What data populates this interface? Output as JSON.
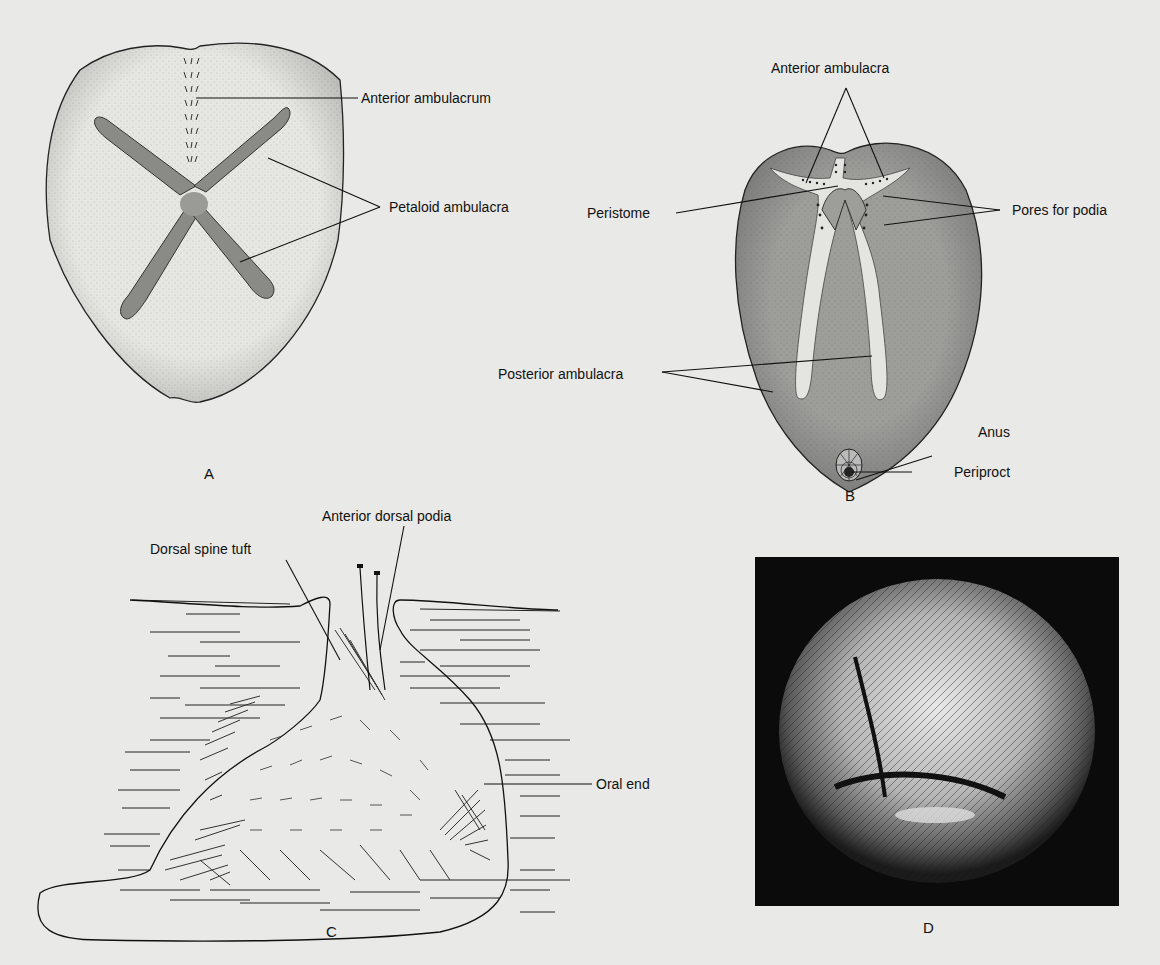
{
  "figure": {
    "background_color": "#e9e9e7",
    "panels": [
      {
        "id": "A",
        "letter": "A",
        "labels": {
          "anterior_ambulacrum": "Anterior ambulacrum",
          "petaloid_ambulacra": "Petaloid ambulacra"
        }
      },
      {
        "id": "B",
        "letter": "B",
        "labels": {
          "anterior_ambulacra": "Anterior ambulacra",
          "peristome": "Peristome",
          "pores_for_podia": "Pores for podia",
          "posterior_ambulacra": "Posterior ambulacra",
          "anus": "Anus",
          "periproct": "Periproct"
        }
      },
      {
        "id": "C",
        "letter": "C",
        "labels": {
          "anterior_dorsal_podia": "Anterior dorsal podia",
          "dorsal_spine_tuft": "Dorsal spine tuft",
          "oral_end": "Oral end"
        }
      },
      {
        "id": "D",
        "letter": "D",
        "description": "photograph of burrowing sea urchin"
      }
    ]
  }
}
